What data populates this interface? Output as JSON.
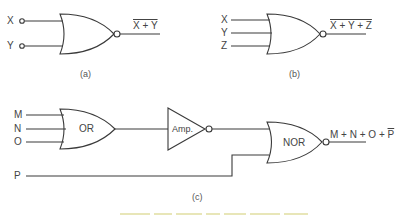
{
  "figure": {
    "a": {
      "caption": "(a)",
      "inputs": [
        "X",
        "Y"
      ],
      "output": "X + Y",
      "output_overlined": true
    },
    "b": {
      "caption": "(b)",
      "inputs": [
        "X",
        "Y",
        "Z"
      ],
      "output": "X + Y + Z",
      "output_overlined": true
    },
    "c": {
      "caption": "(c)",
      "inputs": [
        "M",
        "N",
        "O"
      ],
      "extra_input": "P",
      "or_gate_label": "OR",
      "amp_label": "Amp.",
      "nor_gate_label": "NOR",
      "output_prefix": "M + N + O + ",
      "output_negated_term": "P"
    }
  },
  "colors": {
    "line": "#3a3a3a",
    "background": "#ffffff"
  }
}
